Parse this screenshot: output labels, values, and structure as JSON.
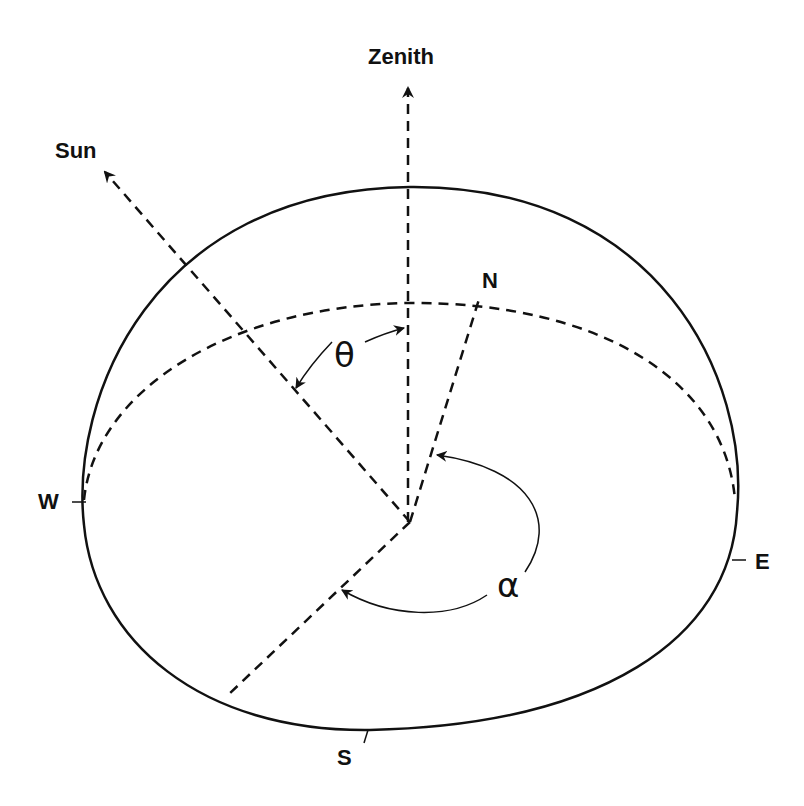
{
  "diagram": {
    "type": "solar-geometry-hemisphere",
    "labels": {
      "zenith": "Zenith",
      "sun": "Sun",
      "north": "N",
      "south": "S",
      "east": "E",
      "west": "W",
      "zenith_angle": "θ",
      "azimuth_angle": "α"
    },
    "colors": {
      "stroke": "#111111",
      "background": "#ffffff"
    },
    "geometry": {
      "origin": [
        410,
        522
      ],
      "zenith_tip": [
        408,
        85
      ],
      "sun_tip": [
        103,
        170
      ],
      "north_end": [
        480,
        296
      ],
      "south_end": [
        228,
        695
      ],
      "dome_top": [
        410,
        187
      ],
      "horizon_peak": [
        410,
        303
      ],
      "west_point": [
        82,
        500
      ],
      "east_point": [
        737,
        512
      ],
      "south_point": [
        370,
        730
      ]
    }
  }
}
